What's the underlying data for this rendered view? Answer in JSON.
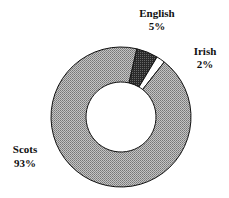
{
  "chart_data": {
    "type": "pie",
    "variant": "donut",
    "title": "",
    "slices": [
      {
        "label": "English",
        "value": 5,
        "value_label": "5%",
        "color": "#3a3a3a",
        "pattern": "dense-dark"
      },
      {
        "label": "Irish",
        "value": 2,
        "value_label": "2%",
        "color": "#ffffff",
        "pattern": "none"
      },
      {
        "label": "Scots",
        "value": 93,
        "value_label": "93%",
        "color": "#a8a8a8",
        "pattern": "stipple"
      }
    ],
    "legend": "none",
    "labels_position": "outside"
  }
}
